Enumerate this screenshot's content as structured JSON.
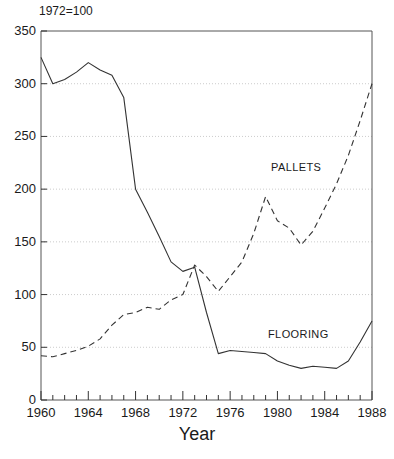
{
  "chart_data": {
    "type": "line",
    "title": "",
    "note": "1972=100",
    "xlabel": "Year",
    "ylabel": "",
    "xlim": [
      1960,
      1988
    ],
    "ylim": [
      0,
      350
    ],
    "grid": true,
    "grid_axis": "y",
    "legend_position": "inline-annotations",
    "yticks": [
      0,
      50,
      100,
      150,
      200,
      250,
      300,
      350
    ],
    "ytick_labels": [
      "0",
      "50",
      "100",
      "150",
      "200",
      "250",
      "300",
      "350"
    ],
    "xticks": [
      1960,
      1964,
      1968,
      1972,
      1976,
      1980,
      1984,
      1988
    ],
    "xtick_labels": [
      "1960",
      "1964",
      "1968",
      "1972",
      "1976",
      "1980",
      "1984",
      "1988"
    ],
    "x_minor_tick_step": 1,
    "x": [
      1960,
      1961,
      1962,
      1963,
      1964,
      1965,
      1966,
      1967,
      1968,
      1969,
      1970,
      1971,
      1972,
      1973,
      1974,
      1975,
      1976,
      1977,
      1978,
      1979,
      1980,
      1981,
      1982,
      1983,
      1984,
      1985,
      1986,
      1987,
      1988
    ],
    "series": [
      {
        "name": "FLOORING",
        "style": "solid",
        "color": "#333333",
        "values": [
          325,
          300,
          304,
          311,
          320,
          313,
          308,
          287,
          200,
          178,
          155,
          131,
          122,
          126,
          83,
          44,
          47,
          46,
          45,
          44,
          37,
          33,
          30,
          32,
          31,
          30,
          37,
          55,
          75
        ]
      },
      {
        "name": "PALLETS",
        "style": "dashed",
        "color": "#333333",
        "values": [
          42,
          41,
          44,
          47,
          51,
          58,
          71,
          81,
          83,
          88,
          86,
          95,
          100,
          128,
          117,
          103,
          117,
          131,
          158,
          193,
          170,
          163,
          147,
          160,
          182,
          205,
          232,
          265,
          300
        ]
      }
    ]
  },
  "annotations": {
    "pallets_label": "PALLETS",
    "flooring_label": "FLOORING"
  }
}
